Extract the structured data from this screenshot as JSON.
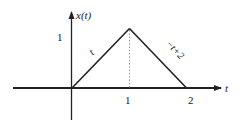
{
  "diagram": {
    "type": "piecewise-linear signal plot",
    "y_axis_label": "x(t)",
    "x_axis_label": "t",
    "y_tick_label": "1",
    "x_tick_labels": [
      "1",
      "2"
    ],
    "segments": [
      {
        "label": "t",
        "from": [
          0,
          0
        ],
        "to": [
          1,
          1
        ]
      },
      {
        "label": "−t+2",
        "from": [
          1,
          1
        ],
        "to": [
          2,
          0
        ]
      }
    ],
    "guide": {
      "style": "dotted",
      "x": 1,
      "from_y": 0,
      "to_y": 1
    },
    "colors": {
      "line": "#222222",
      "axis": "#222222",
      "background": "#ffffff"
    }
  }
}
